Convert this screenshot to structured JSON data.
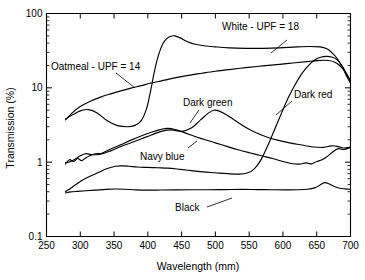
{
  "chart_data": {
    "type": "line",
    "title": "",
    "xlabel": "Wavelength (mm)",
    "ylabel": "Transmission (%)",
    "xlim": [
      250,
      700
    ],
    "ylim": [
      0.1,
      100
    ],
    "yscale": "log",
    "xticks": [
      250,
      300,
      350,
      400,
      450,
      500,
      550,
      600,
      650,
      700
    ],
    "xtick_labels": [
      "250",
      "300",
      "350",
      "400",
      "450",
      "500",
      "550",
      "600",
      "650",
      "700"
    ],
    "yticks": [
      0.1,
      1,
      10,
      100
    ],
    "ytick_labels": [
      "0.1",
      "1",
      "10",
      "100"
    ],
    "grid": false,
    "legend_position": "inline-annotations",
    "series": [
      {
        "name": "White - UPF = 18",
        "label": "White - UPF = 18",
        "x": [
          278,
          290,
          300,
          312,
          325,
          340,
          355,
          370,
          380,
          390,
          398,
          404,
          410,
          416,
          422,
          428,
          434,
          440,
          448,
          458,
          470,
          485,
          500,
          520,
          545,
          570,
          595,
          620,
          640,
          655,
          665,
          672,
          680,
          688,
          694,
          700
        ],
        "y": [
          3.8,
          4.4,
          4.9,
          5.1,
          4.6,
          3.6,
          3.1,
          3.0,
          3.1,
          3.6,
          5.2,
          9.0,
          17.0,
          28.0,
          39.0,
          46.0,
          49.5,
          50.0,
          47.0,
          42.0,
          38.5,
          36.5,
          35.5,
          34.5,
          34.0,
          34.0,
          34.5,
          35.5,
          36.0,
          35.5,
          33.5,
          30.0,
          25.0,
          19.0,
          14.5,
          11.5
        ]
      },
      {
        "name": "Oatmeal - UPF = 14",
        "label": "Oatmeal - UPF = 14",
        "x": [
          278,
          288,
          300,
          315,
          330,
          345,
          360,
          375,
          390,
          405,
          420,
          440,
          460,
          480,
          500,
          520,
          545,
          570,
          595,
          615,
          635,
          650,
          660,
          668,
          676,
          684,
          692,
          700
        ],
        "y": [
          3.7,
          4.6,
          5.6,
          6.6,
          7.5,
          8.3,
          9.1,
          9.9,
          10.7,
          11.6,
          12.4,
          13.6,
          14.7,
          15.7,
          16.7,
          17.6,
          18.7,
          19.7,
          20.7,
          21.6,
          22.5,
          23.2,
          23.5,
          23.3,
          22.3,
          20.0,
          16.5,
          12.5
        ]
      },
      {
        "name": "Dark green",
        "label": "Dark green",
        "x": [
          278,
          286,
          294,
          300,
          308,
          318,
          330,
          345,
          360,
          375,
          390,
          405,
          420,
          435,
          450,
          465,
          478,
          490,
          498,
          505,
          515,
          528,
          542,
          558,
          575,
          592,
          610,
          628,
          645,
          660,
          672,
          682,
          690,
          700
        ],
        "y": [
          0.98,
          1.02,
          1.12,
          1.22,
          1.3,
          1.26,
          1.28,
          1.42,
          1.62,
          1.82,
          2.05,
          2.32,
          2.6,
          2.72,
          2.6,
          2.9,
          3.7,
          4.6,
          5.0,
          4.9,
          4.4,
          3.7,
          3.05,
          2.55,
          2.2,
          1.98,
          1.82,
          1.7,
          1.6,
          1.58,
          1.66,
          1.62,
          1.55,
          1.6
        ]
      },
      {
        "name": "Navy blue",
        "label": "Navy blue",
        "x": [
          278,
          284,
          290,
          296,
          302,
          308,
          314,
          322,
          332,
          345,
          360,
          375,
          390,
          405,
          418,
          430,
          442,
          455,
          470,
          485,
          500,
          518,
          535,
          552,
          568,
          585,
          600,
          612,
          624,
          634,
          642,
          650,
          658,
          666,
          674,
          682,
          690,
          700
        ],
        "y": [
          0.95,
          1.08,
          1.02,
          1.12,
          1.05,
          1.14,
          1.22,
          1.3,
          1.32,
          1.5,
          1.72,
          1.98,
          2.25,
          2.52,
          2.74,
          2.85,
          2.72,
          2.48,
          2.22,
          2.0,
          1.82,
          1.62,
          1.46,
          1.33,
          1.22,
          1.12,
          1.02,
          0.96,
          0.94,
          0.98,
          0.95,
          1.02,
          1.08,
          1.2,
          1.38,
          1.52,
          1.48,
          1.58
        ]
      },
      {
        "name": "Dark red",
        "label": "Dark red",
        "x": [
          278,
          288,
          300,
          312,
          326,
          340,
          352,
          362,
          372,
          385,
          400,
          415,
          430,
          448,
          465,
          482,
          500,
          518,
          535,
          548,
          558,
          568,
          578,
          588,
          598,
          608,
          618,
          628,
          638,
          648,
          656,
          664,
          672,
          680,
          688,
          694,
          700
        ],
        "y": [
          0.4,
          0.46,
          0.55,
          0.63,
          0.72,
          0.82,
          0.88,
          0.89,
          0.88,
          0.86,
          0.85,
          0.84,
          0.83,
          0.8,
          0.77,
          0.74,
          0.72,
          0.7,
          0.69,
          0.72,
          0.82,
          1.1,
          1.7,
          2.8,
          4.6,
          7.4,
          11.0,
          15.5,
          20.0,
          24.0,
          25.8,
          26.5,
          26.0,
          24.0,
          19.5,
          15.5,
          12.0
        ]
      },
      {
        "name": "Black",
        "label": "Black",
        "x": [
          278,
          286,
          296,
          308,
          322,
          338,
          352,
          366,
          382,
          400,
          420,
          442,
          465,
          490,
          515,
          540,
          562,
          585,
          605,
          622,
          636,
          648,
          656,
          662,
          668,
          676,
          684,
          692,
          700
        ],
        "y": [
          0.385,
          0.398,
          0.405,
          0.412,
          0.42,
          0.43,
          0.435,
          0.432,
          0.424,
          0.42,
          0.422,
          0.424,
          0.425,
          0.426,
          0.428,
          0.43,
          0.428,
          0.426,
          0.424,
          0.425,
          0.432,
          0.455,
          0.5,
          0.53,
          0.512,
          0.47,
          0.446,
          0.438,
          0.432
        ]
      }
    ],
    "annotations": [
      {
        "text": "White - UPF = 18",
        "text_x": 300,
        "text_y": 0,
        "leader_from": [
          0,
          0
        ],
        "leader_to": [
          0,
          0
        ]
      },
      {
        "text": "Oatmeal - UPF = 14",
        "text_x": 0,
        "text_y": 0,
        "leader_from": [
          0,
          0
        ],
        "leader_to": [
          0,
          0
        ]
      }
    ]
  },
  "labels": {
    "white": "White - UPF = 18",
    "oatmeal": "Oatmeal - UPF = 14",
    "dark_green": "Dark green",
    "navy_blue": "Navy blue",
    "dark_red": "Dark red",
    "black": "Black",
    "x_axis": "Wavelength (mm)",
    "y_axis": "Transmission (%)"
  },
  "xtick_labels": {
    "t0": "250",
    "t1": "300",
    "t2": "350",
    "t3": "400",
    "t4": "450",
    "t5": "500",
    "t6": "550",
    "t7": "600",
    "t8": "650",
    "t9": "700"
  },
  "ytick_labels": {
    "t0": "0.1",
    "t1": "1",
    "t2": "10",
    "t3": "100"
  },
  "colors": {
    "ink": "#000000",
    "background": "#ffffff"
  }
}
